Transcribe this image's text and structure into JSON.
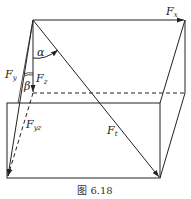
{
  "figure": {
    "caption": "图 6.18",
    "labels": {
      "Fx": {
        "main": "F",
        "sub": "x"
      },
      "Fy": {
        "main": "F",
        "sub": "y"
      },
      "Fz": {
        "main": "F",
        "sub": "z"
      },
      "Fyz": {
        "main": "F",
        "sub": "yz"
      },
      "Ft": {
        "main": "F",
        "sub": "t"
      },
      "alpha": "α",
      "beta": "β"
    },
    "colors": {
      "line": "#222222",
      "background": "#ffffff"
    }
  }
}
